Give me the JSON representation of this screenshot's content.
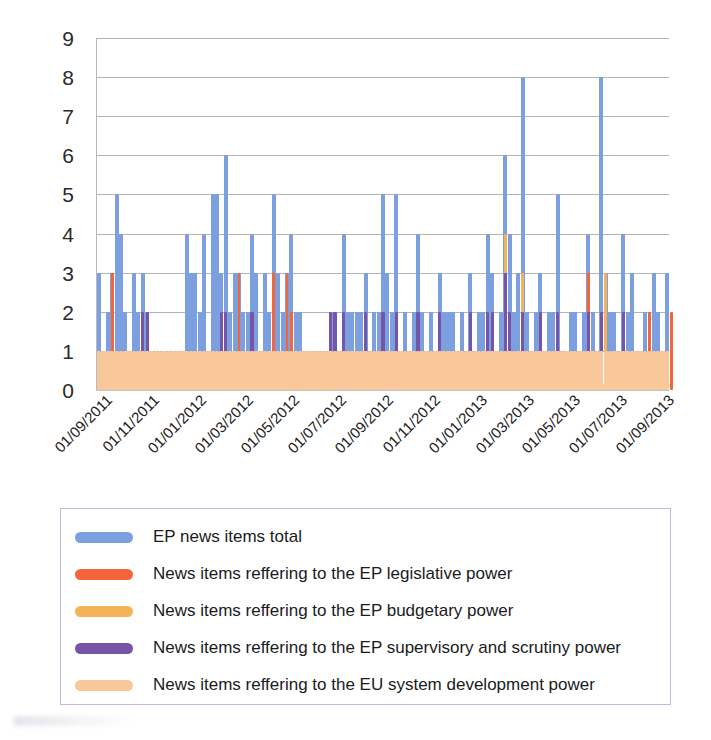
{
  "chart_data": {
    "type": "bar",
    "title": "",
    "subtitle": "",
    "xlabel": "",
    "ylabel": "",
    "ylim": [
      0,
      9
    ],
    "y_ticks": [
      0,
      1,
      2,
      3,
      4,
      5,
      6,
      7,
      8,
      9
    ],
    "grid": true,
    "legend_position": "bottom",
    "x_tick_labels": [
      "01/09/2011",
      "01/11/2011",
      "01/01/2012",
      "01/03/2012",
      "01/05/2012",
      "01/07/2012",
      "01/09/2012",
      "01/11/2012",
      "01/01/2013",
      "01/03/2013",
      "01/05/2013",
      "01/07/2013",
      "01/09/2013"
    ],
    "x_range": [
      "01/09/2011",
      "01/09/2013"
    ],
    "x_tick_interval": "2 months",
    "colors": {
      "total": "#7c9fe0",
      "legislative": "#f4663a",
      "budgetary": "#f5b357",
      "supervisory": "#7654a8",
      "development": "#f8c89a",
      "gridline": "#b4b4b4",
      "axis": "#b9b9b9",
      "legend_border": "#c9b6d8"
    },
    "series": [
      {
        "name": "EP news items total",
        "color": "#7c9fe0",
        "values": [
          3,
          1,
          2,
          3,
          5,
          4,
          2,
          1,
          3,
          2,
          3,
          2,
          1,
          1,
          1,
          1,
          1,
          1,
          0,
          0,
          4,
          3,
          3,
          2,
          4,
          1,
          5,
          5,
          3,
          6,
          2,
          3,
          3,
          2,
          2,
          4,
          3,
          1,
          3,
          2,
          5,
          3,
          2,
          3,
          4,
          2,
          2,
          1,
          0,
          0,
          1,
          1,
          1,
          2,
          2,
          1,
          4,
          2,
          2,
          2,
          2,
          3,
          1,
          2,
          2,
          5,
          3,
          2,
          5,
          1,
          2,
          1,
          2,
          4,
          2,
          1,
          2,
          1,
          3,
          2,
          2,
          2,
          1,
          2,
          1,
          3,
          1,
          2,
          2,
          4,
          3,
          1,
          2,
          6,
          4,
          2,
          3,
          8,
          2,
          1,
          2,
          3,
          1,
          2,
          2,
          5,
          1,
          1,
          2,
          2,
          1,
          2,
          4,
          2,
          1,
          8,
          3,
          2,
          2,
          1,
          4,
          2,
          3,
          1,
          1,
          2,
          1,
          3,
          2,
          1,
          3
        ]
      },
      {
        "name": "News items reffering to the EP legislative power",
        "color": "#f4663a",
        "values": [
          1,
          1,
          0,
          3,
          1,
          0,
          0,
          0,
          0,
          0,
          0,
          0,
          0,
          0,
          0,
          0,
          0,
          0,
          0,
          0,
          0,
          0,
          0,
          0,
          0,
          0,
          0,
          0,
          0,
          0,
          0,
          0,
          3,
          0,
          0,
          2,
          0,
          0,
          1,
          0,
          3,
          0,
          0,
          3,
          2,
          0,
          0,
          0,
          0,
          0,
          0,
          0,
          0,
          0,
          0,
          0,
          0,
          0,
          0,
          0,
          0,
          0,
          0,
          0,
          0,
          0,
          0,
          0,
          0,
          0,
          0,
          0,
          0,
          0,
          0,
          0,
          0,
          0,
          0,
          0,
          0,
          0,
          0,
          0,
          0,
          0,
          0,
          0,
          0,
          0,
          0,
          0,
          0,
          3,
          0,
          0,
          0,
          2,
          0,
          0,
          0,
          0,
          0,
          0,
          0,
          0,
          0,
          0,
          0,
          0,
          0,
          0,
          3,
          0,
          0,
          0,
          0,
          0,
          0,
          0,
          0,
          0,
          0,
          0,
          0,
          0,
          2,
          0,
          0,
          0,
          0,
          2
        ]
      },
      {
        "name": "News items reffering to the EP budgetary power",
        "color": "#f5b357",
        "values": [
          0,
          0,
          0,
          0,
          0,
          0,
          0,
          0,
          0,
          0,
          0,
          0,
          0,
          0,
          0,
          0,
          0,
          0,
          0,
          0,
          0,
          0,
          0,
          0,
          0,
          0,
          0,
          0,
          2,
          0,
          0,
          0,
          0,
          0,
          0,
          0,
          0,
          0,
          0,
          0,
          0,
          0,
          0,
          0,
          0,
          0,
          0,
          0,
          0,
          0,
          0,
          0,
          0,
          0,
          0,
          0,
          0,
          0,
          0,
          0,
          0,
          0,
          0,
          0,
          0,
          0,
          0,
          0,
          0,
          0,
          0,
          0,
          0,
          0,
          0,
          0,
          0,
          0,
          0,
          0,
          0,
          0,
          0,
          0,
          0,
          0,
          0,
          0,
          0,
          0,
          0,
          0,
          0,
          4,
          0,
          0,
          0,
          3,
          0,
          0,
          0,
          0,
          0,
          0,
          0,
          0,
          0,
          0,
          0,
          0,
          0,
          0,
          0,
          0,
          0,
          0,
          3,
          0,
          0,
          0,
          0,
          0,
          0,
          0,
          0,
          0,
          0,
          0,
          0
        ]
      },
      {
        "name": "News items reffering to the EP supervisory and scrutiny power",
        "color": "#7654a8",
        "values": [
          1,
          1,
          1,
          1,
          1,
          1,
          0,
          0,
          1,
          0,
          2,
          2,
          1,
          1,
          1,
          1,
          1,
          1,
          0,
          0,
          1,
          1,
          1,
          0,
          1,
          0,
          1,
          1,
          2,
          2,
          1,
          1,
          1,
          1,
          1,
          2,
          1,
          1,
          1,
          1,
          1,
          1,
          1,
          1,
          1,
          1,
          1,
          1,
          0,
          0,
          1,
          1,
          1,
          2,
          2,
          1,
          2,
          1,
          1,
          1,
          1,
          2,
          1,
          1,
          1,
          2,
          1,
          1,
          2,
          1,
          1,
          1,
          1,
          2,
          1,
          1,
          1,
          1,
          2,
          1,
          1,
          1,
          1,
          1,
          1,
          2,
          1,
          1,
          1,
          2,
          2,
          1,
          1,
          3,
          2,
          1,
          1,
          2,
          1,
          1,
          1,
          2,
          1,
          1,
          1,
          2,
          1,
          1,
          1,
          1,
          1,
          1,
          2,
          1,
          1,
          2,
          1,
          1,
          1,
          1,
          2,
          1,
          1,
          1,
          1,
          1,
          1,
          1,
          1,
          1,
          1
        ]
      },
      {
        "name": "News items reffering to the EU system development power",
        "color": "#f8c89a",
        "values": [
          1,
          1,
          1,
          1,
          1,
          1,
          1,
          1,
          1,
          1,
          1,
          1,
          1,
          1,
          1,
          1,
          1,
          1,
          1,
          1,
          1,
          1,
          1,
          1,
          1,
          1,
          1,
          1,
          1,
          1,
          1,
          1,
          1,
          1,
          1,
          1,
          1,
          1,
          1,
          1,
          1,
          1,
          1,
          1,
          1,
          1,
          1,
          1,
          1,
          1,
          1,
          1,
          1,
          1,
          1,
          1,
          1,
          1,
          1,
          1,
          1,
          1,
          1,
          1,
          1,
          1,
          1,
          1,
          1,
          1,
          1,
          1,
          1,
          1,
          1,
          1,
          1,
          1,
          1,
          1,
          1,
          1,
          1,
          1,
          1,
          1,
          1,
          1,
          1,
          1,
          1,
          1,
          1,
          1,
          1,
          1,
          1,
          1,
          1,
          1,
          1,
          1,
          1,
          1,
          1,
          1,
          1,
          1,
          1,
          1,
          1,
          1,
          1,
          1,
          1,
          1,
          1,
          1,
          1,
          1,
          1,
          1,
          1,
          1,
          1,
          1,
          1,
          1,
          1,
          1,
          1
        ]
      }
    ]
  },
  "legend": {
    "items": [
      {
        "label": "EP news items total",
        "color": "#7c9fe0",
        "swatch": "legend-swatch-total"
      },
      {
        "label": "News items reffering to the EP legislative power",
        "color": "#f4663a",
        "swatch": "legend-swatch-legislative"
      },
      {
        "label": "News items reffering to the EP budgetary power",
        "color": "#f5b357",
        "swatch": "legend-swatch-budgetary"
      },
      {
        "label": "News items reffering to the EP supervisory and scrutiny power",
        "color": "#7654a8",
        "swatch": "legend-swatch-supervisory"
      },
      {
        "label": "News items reffering to the EU system development power",
        "color": "#f8c89a",
        "swatch": "legend-swatch-development"
      }
    ]
  }
}
